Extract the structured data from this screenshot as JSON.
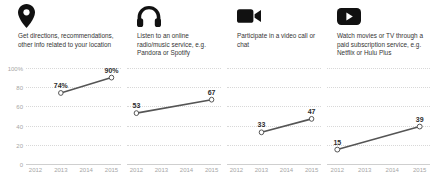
{
  "chart_data": [
    {
      "type": "line",
      "title": "Get directions, recommendations, other info related to your location",
      "icon": "location-pin-icon",
      "x": [
        2013,
        2015
      ],
      "values": [
        74,
        90
      ],
      "point_labels": [
        "74%",
        "90%"
      ],
      "categories": [
        "2012",
        "2013",
        "2014",
        "2015"
      ],
      "ylim": [
        0,
        100
      ],
      "yticks": [
        "0",
        "20",
        "40",
        "60",
        "80",
        "100%"
      ],
      "ytick_values": [
        0,
        20,
        40,
        60,
        80,
        100
      ],
      "show_ylabels": true,
      "grid": true,
      "xlabel": "",
      "ylabel": ""
    },
    {
      "type": "line",
      "title": "Listen to an online radio/music service, e.g. Pandora or Spotify",
      "icon": "headphones-icon",
      "x": [
        2012,
        2015
      ],
      "values": [
        53,
        67
      ],
      "point_labels": [
        "53",
        "67"
      ],
      "categories": [
        "2012",
        "2013",
        "2014",
        "2015"
      ],
      "ylim": [
        0,
        100
      ],
      "yticks": [
        "0",
        "20",
        "40",
        "60",
        "80",
        "100%"
      ],
      "ytick_values": [
        0,
        20,
        40,
        60,
        80,
        100
      ],
      "show_ylabels": false,
      "grid": true,
      "xlabel": "",
      "ylabel": ""
    },
    {
      "type": "line",
      "title": "Participate in a video call or chat",
      "icon": "video-camera-icon",
      "x": [
        2013,
        2015
      ],
      "values": [
        33,
        47
      ],
      "point_labels": [
        "33",
        "47"
      ],
      "categories": [
        "2012",
        "2013",
        "2014",
        "2015"
      ],
      "ylim": [
        0,
        100
      ],
      "yticks": [
        "0",
        "20",
        "40",
        "60",
        "80",
        "100%"
      ],
      "ytick_values": [
        0,
        20,
        40,
        60,
        80,
        100
      ],
      "show_ylabels": false,
      "grid": true,
      "xlabel": "",
      "ylabel": ""
    },
    {
      "type": "line",
      "title": "Watch movies or TV through a paid subscription service, e.g. Netflix or Hulu Plus",
      "icon": "play-button-icon",
      "x": [
        2012,
        2015
      ],
      "values": [
        15,
        39
      ],
      "point_labels": [
        "15",
        "39"
      ],
      "categories": [
        "2012",
        "2013",
        "2014",
        "2015"
      ],
      "ylim": [
        0,
        100
      ],
      "yticks": [
        "0",
        "20",
        "40",
        "60",
        "80",
        "100%"
      ],
      "ytick_values": [
        0,
        20,
        40,
        60,
        80,
        100
      ],
      "show_ylabels": false,
      "grid": true,
      "xlabel": "",
      "ylabel": ""
    }
  ],
  "style": {
    "line_color": "#555555",
    "marker_fill": "#ffffff",
    "marker_stroke": "#555555",
    "grid_color": "#d8d8d8",
    "tick_label_color": "#a6a6a6",
    "caption_color": "#353535",
    "icon_color": "#111111"
  }
}
